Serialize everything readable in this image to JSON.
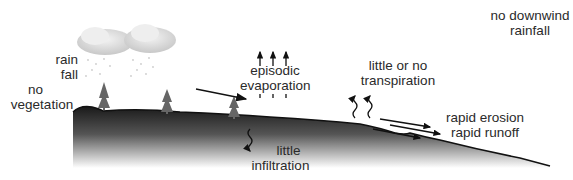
{
  "diagram": {
    "title": "",
    "labels": {
      "rainfall_1": "rain",
      "rainfall_2": "fall",
      "no_vegetation_1": "no",
      "no_vegetation_2": "vegetation",
      "episodic_evaporation_1": "episodic",
      "episodic_evaporation_2": "evaporation",
      "transpiration_1": "little or  no",
      "transpiration_2": "transpiration",
      "no_downwind_1": "no downwind",
      "no_downwind_2": "rainfall",
      "erosion": "rapid erosion",
      "runoff": "rapid runoff",
      "infiltration_1": "little",
      "infiltration_2": "infiltration"
    },
    "elements": {
      "clouds": 2,
      "trees": 3,
      "evaporation_arrows": 3,
      "transpiration_squiggles": 2,
      "runoff_arrows": 3
    },
    "colors": {
      "ground_dark": "#1e1e1e",
      "ground_fade": "#ffffff",
      "cloud": "#d9d9d9",
      "text": "#2a2a2a"
    }
  }
}
